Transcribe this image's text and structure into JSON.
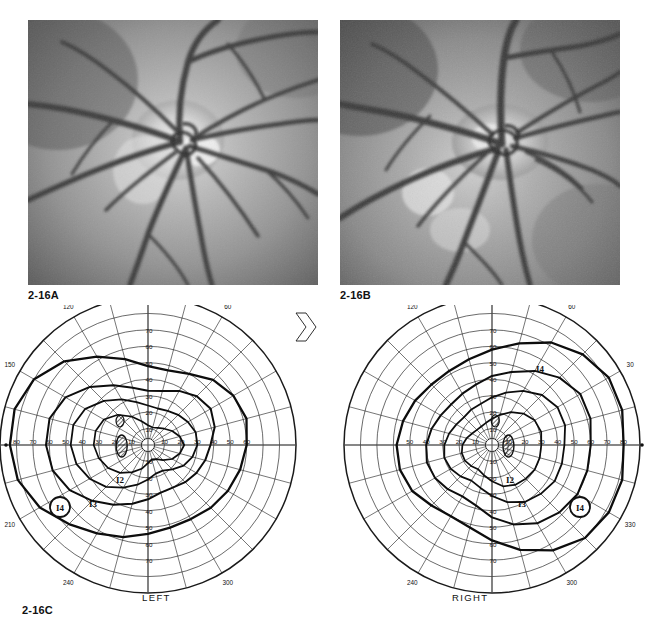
{
  "page": {
    "faint_header": "",
    "figure_labels": {
      "a": "2-16A",
      "b": "2-16B",
      "c": "2-16C"
    }
  },
  "photographs": [
    {
      "id": "fundus-photo-a",
      "label": "2-16A",
      "description": "grayscale fundus photograph, optic disc with radiating retinal vessels"
    },
    {
      "id": "fundus-photo-b",
      "label": "2-16B",
      "description": "grayscale fundus photograph, optic disc with radiating retinal vessels"
    }
  ],
  "chart_data": {
    "type": "polar",
    "title": "2-16C",
    "subtype": "goldmann-binocular-visual-field",
    "eyes": [
      {
        "name": "LEFT",
        "caption": "LEFT",
        "meridian_labels": [
          "150",
          "120",
          "90",
          "60",
          "210",
          "240",
          "270",
          "300"
        ],
        "edge_marker": "0",
        "radial_ticks_vertical_up": [
          "70",
          "60",
          "50",
          "40",
          "30",
          "20",
          "10"
        ],
        "radial_ticks_vertical_down": [
          "10",
          "20",
          "30",
          "40",
          "50",
          "60",
          "70"
        ],
        "radial_ticks_horizontal_left": [
          "80",
          "70",
          "60",
          "50",
          "40",
          "30",
          "20",
          "10"
        ],
        "radial_ticks_horizontal_right": [
          "10",
          "20",
          "30",
          "40",
          "50",
          "60"
        ],
        "isopter_labels": [
          "I4",
          "I3",
          "I2"
        ],
        "blind_spot": "hatched scotoma nasal to fixation"
      },
      {
        "name": "RIGHT",
        "caption": "RIGHT",
        "meridian_labels": [
          "120",
          "90",
          "60",
          "30",
          "240",
          "270",
          "300",
          "330"
        ],
        "edge_marker": "0",
        "radial_ticks_vertical_up": [
          "70",
          "60",
          "50",
          "40",
          "30",
          "20",
          "10"
        ],
        "radial_ticks_vertical_down": [
          "10",
          "20",
          "30",
          "40",
          "50",
          "60",
          "70"
        ],
        "radial_ticks_horizontal_left": [
          "50",
          "40",
          "30",
          "20",
          "10"
        ],
        "radial_ticks_horizontal_right": [
          "10",
          "20",
          "30",
          "40",
          "50",
          "60",
          "70",
          "80"
        ],
        "isopter_labels": [
          "I4",
          "I3",
          "I2"
        ],
        "blind_spot": "hatched scotoma temporal to fixation"
      }
    ],
    "radial_grid_rings": [
      10,
      20,
      30,
      40,
      50,
      60,
      70,
      80,
      90
    ],
    "meridian_step_degrees": 15,
    "grid": true,
    "legend_position": "none",
    "xlabel": "",
    "ylabel": ""
  }
}
